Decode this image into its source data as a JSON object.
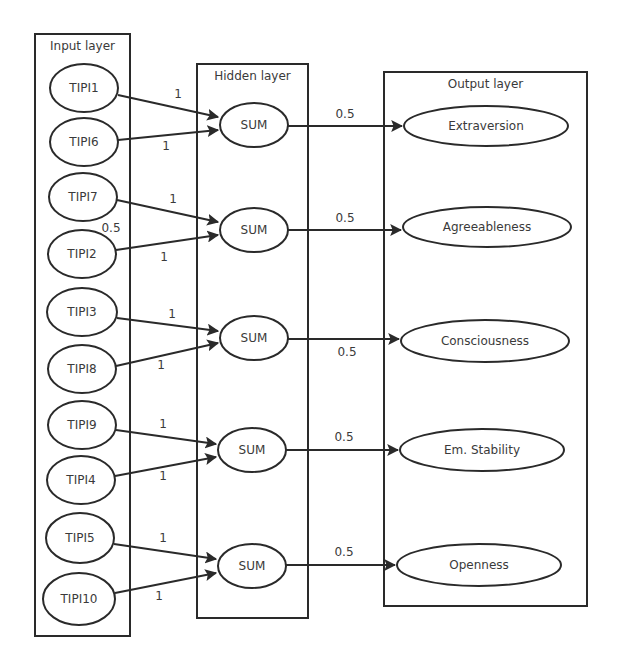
{
  "layers": {
    "input": {
      "title": "Input layer",
      "box": [
        35,
        34,
        95,
        602
      ]
    },
    "hidden": {
      "title": "Hidden layer",
      "box": [
        197,
        64,
        111,
        554
      ]
    },
    "output": {
      "title": "Output layer",
      "box": [
        384,
        72,
        203,
        534
      ]
    }
  },
  "input_nodes": [
    {
      "label": "TIPI1",
      "cx": 84,
      "cy": 88,
      "rx": 34,
      "ry": 24
    },
    {
      "label": "TIPI6",
      "cx": 84,
      "cy": 142,
      "rx": 34,
      "ry": 24
    },
    {
      "label": "TIPI7",
      "cx": 83,
      "cy": 197,
      "rx": 34,
      "ry": 24
    },
    {
      "label": "TIPI2",
      "cx": 82,
      "cy": 254,
      "rx": 34,
      "ry": 24
    },
    {
      "label": "TIPI3",
      "cx": 82,
      "cy": 312,
      "rx": 35,
      "ry": 24
    },
    {
      "label": "TIPI8",
      "cx": 82,
      "cy": 369,
      "rx": 34,
      "ry": 24
    },
    {
      "label": "TIPI9",
      "cx": 82,
      "cy": 425,
      "rx": 34,
      "ry": 24
    },
    {
      "label": "TIPI4",
      "cx": 81,
      "cy": 480,
      "rx": 34,
      "ry": 24
    },
    {
      "label": "TIPI5",
      "cx": 80,
      "cy": 538,
      "rx": 34,
      "ry": 25
    },
    {
      "label": "TIPI10",
      "cx": 79,
      "cy": 599,
      "rx": 36,
      "ry": 26
    }
  ],
  "hidden_nodes": [
    {
      "label": "SUM",
      "cx": 254,
      "cy": 125,
      "rx": 34,
      "ry": 22
    },
    {
      "label": "SUM",
      "cx": 254,
      "cy": 230,
      "rx": 34,
      "ry": 22
    },
    {
      "label": "SUM",
      "cx": 254,
      "cy": 338,
      "rx": 34,
      "ry": 22
    },
    {
      "label": "SUM",
      "cx": 252,
      "cy": 450,
      "rx": 34,
      "ry": 22
    },
    {
      "label": "SUM",
      "cx": 252,
      "cy": 566,
      "rx": 34,
      "ry": 22
    }
  ],
  "output_nodes": [
    {
      "label": "Extraversion",
      "cx": 486,
      "cy": 126,
      "rx": 82,
      "ry": 20
    },
    {
      "label": "Agreeableness",
      "cx": 487,
      "cy": 227,
      "rx": 84,
      "ry": 20
    },
    {
      "label": "Consciousness",
      "cx": 485,
      "cy": 341,
      "rx": 84,
      "ry": 21
    },
    {
      "label": "Em. Stability",
      "cx": 482,
      "cy": 450,
      "rx": 82,
      "ry": 21
    },
    {
      "label": "Openness",
      "cx": 479,
      "cy": 565,
      "rx": 82,
      "ry": 21
    }
  ],
  "input_edges": [
    {
      "from": 0,
      "to": 0,
      "weight": "1",
      "x1": 118,
      "y1": 95,
      "x2": 218,
      "y2": 117,
      "lx": 178,
      "ly": 98
    },
    {
      "from": 1,
      "to": 0,
      "weight": "1",
      "x1": 118,
      "y1": 140,
      "x2": 218,
      "y2": 130,
      "lx": 166,
      "ly": 150
    },
    {
      "from": 2,
      "to": 1,
      "weight": "1",
      "x1": 117,
      "y1": 200,
      "x2": 218,
      "y2": 222,
      "lx": 173,
      "ly": 203
    },
    {
      "from": 3,
      "to": 1,
      "weight": "1",
      "x1": 116,
      "y1": 250,
      "x2": 218,
      "y2": 235,
      "lx": 164,
      "ly": 261
    },
    {
      "from": 4,
      "to": 2,
      "weight": "1",
      "x1": 117,
      "y1": 318,
      "x2": 218,
      "y2": 331,
      "lx": 172,
      "ly": 318
    },
    {
      "from": 5,
      "to": 2,
      "weight": "1",
      "x1": 116,
      "y1": 366,
      "x2": 218,
      "y2": 343,
      "lx": 161,
      "ly": 369
    },
    {
      "from": 6,
      "to": 3,
      "weight": "1",
      "x1": 116,
      "y1": 430,
      "x2": 216,
      "y2": 444,
      "lx": 163,
      "ly": 428
    },
    {
      "from": 7,
      "to": 3,
      "weight": "1",
      "x1": 115,
      "y1": 476,
      "x2": 216,
      "y2": 457,
      "lx": 163,
      "ly": 480
    },
    {
      "from": 8,
      "to": 4,
      "weight": "1",
      "x1": 114,
      "y1": 544,
      "x2": 216,
      "y2": 559,
      "lx": 163,
      "ly": 542
    },
    {
      "from": 9,
      "to": 4,
      "weight": "1",
      "x1": 115,
      "y1": 593,
      "x2": 216,
      "y2": 573,
      "lx": 159,
      "ly": 600
    }
  ],
  "output_edges": [
    {
      "from": 0,
      "to": 0,
      "weight": "0.5",
      "x1": 288,
      "y1": 126,
      "x2": 402,
      "y2": 126,
      "lx": 345,
      "ly": 118
    },
    {
      "from": 1,
      "to": 1,
      "weight": "0.5",
      "x1": 288,
      "y1": 230,
      "x2": 401,
      "y2": 230,
      "lx": 345,
      "ly": 222
    },
    {
      "from": 2,
      "to": 2,
      "weight": "0.5",
      "x1": 288,
      "y1": 339,
      "x2": 399,
      "y2": 339,
      "lx": 347,
      "ly": 356
    },
    {
      "from": 3,
      "to": 3,
      "weight": "0.5",
      "x1": 286,
      "y1": 450,
      "x2": 398,
      "y2": 450,
      "lx": 344,
      "ly": 441
    },
    {
      "from": 4,
      "to": 4,
      "weight": "0.5",
      "x1": 286,
      "y1": 565,
      "x2": 395,
      "y2": 565,
      "lx": 344,
      "ly": 556
    }
  ],
  "extra_labels": [
    {
      "text": "0.5",
      "x": 111,
      "y": 232
    }
  ]
}
